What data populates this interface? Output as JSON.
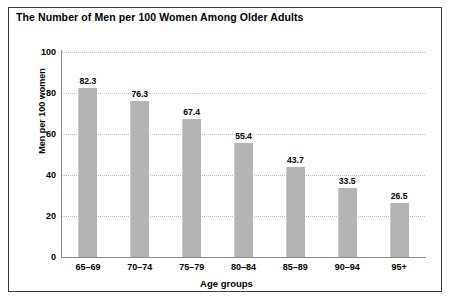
{
  "chart_data": {
    "type": "bar",
    "title": "The Number of Men per 100 Women Among Older Adults",
    "xlabel": "Age groups",
    "ylabel": "Men per 100 women",
    "categories": [
      "65–69",
      "70–74",
      "75–79",
      "80–84",
      "85–89",
      "90–94",
      "95+"
    ],
    "values": [
      82.3,
      76.3,
      67.4,
      55.4,
      43.7,
      33.5,
      26.5
    ],
    "value_labels": [
      "82.3",
      "76.3",
      "67.4",
      "55.4",
      "43.7",
      "33.5",
      "26.5"
    ],
    "ylim": [
      0,
      100
    ],
    "yticks": [
      0,
      20,
      40,
      60,
      80,
      100
    ],
    "ytick_labels": [
      "0",
      "20",
      "40",
      "60",
      "80",
      "100"
    ],
    "grid": "horizontal-dotted",
    "legend": null,
    "bar_color": "#b4b4b4",
    "grid_color": "#bdbdbd",
    "axis_color": "#8a8a8a",
    "border_color": "#3a3a3a",
    "text_color": "#000000"
  }
}
